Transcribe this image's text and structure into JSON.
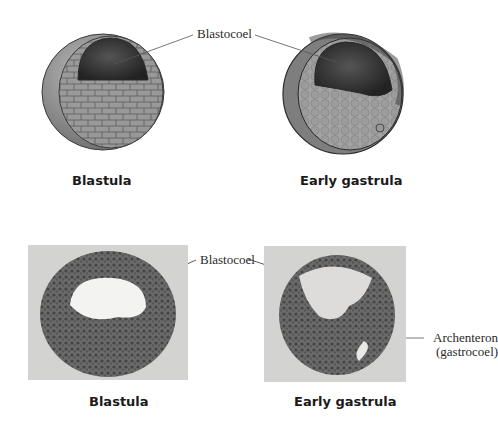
{
  "top_row": {
    "blastula": {
      "caption": "Blastula"
    },
    "early_gastrula": {
      "caption": "Early gastrula"
    },
    "label_blastocoel": "Blastocoel"
  },
  "bottom_row": {
    "blastula": {
      "caption": "Blastula"
    },
    "early_gastrula": {
      "caption": "Early gastrula"
    },
    "label_blastocoel": "Blastocoel",
    "label_archenteron": "Archenteron",
    "label_archenteron_alt": "(gastrocoel)"
  },
  "colors": {
    "background": "#ffffff",
    "photo_background": "#d3d3d1",
    "embryo_gray": "#8f8f8f",
    "cavity_dark": "#3a3a3a",
    "leader_line": "#555555"
  }
}
